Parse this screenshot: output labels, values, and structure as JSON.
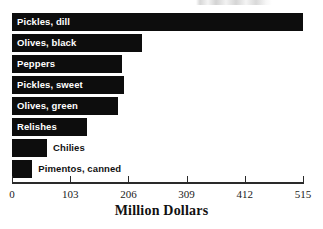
{
  "chart_data": {
    "type": "bar",
    "orientation": "horizontal",
    "title": "",
    "xlabel": "Million Dollars",
    "ylabel": "",
    "categories": [
      "Pickles, dill",
      "Olives, black",
      "Peppers",
      "Pickles, sweet",
      "Olives, green",
      "Relishes",
      "Chilies",
      "Pimentos, canned"
    ],
    "values": [
      515,
      230,
      195,
      198,
      187,
      133,
      62,
      36
    ],
    "xlim": [
      0,
      515
    ],
    "xticks": [
      0,
      103,
      206,
      309,
      412,
      515
    ],
    "xtick_labels": [
      "0",
      "103",
      "206",
      "309",
      "412",
      "515"
    ],
    "grid": false,
    "legend": null,
    "bar_color": "#0d0d0d",
    "label_inside_color": "#ffffff",
    "label_outside_color": "#111111",
    "background_color": "#ffffff"
  },
  "bars": [
    {
      "label": "Pickles, dill",
      "value": 515,
      "label_placement": "inside"
    },
    {
      "label": "Olives, black",
      "value": 230,
      "label_placement": "inside"
    },
    {
      "label": "Peppers",
      "value": 195,
      "label_placement": "inside"
    },
    {
      "label": "Pickles, sweet",
      "value": 198,
      "label_placement": "inside"
    },
    {
      "label": "Olives, green",
      "value": 187,
      "label_placement": "inside"
    },
    {
      "label": "Relishes",
      "value": 133,
      "label_placement": "inside"
    },
    {
      "label": "Chilies",
      "value": 62,
      "label_placement": "outside"
    },
    {
      "label": "Pimentos, canned",
      "value": 36,
      "label_placement": "outside"
    }
  ],
  "axis": {
    "xlabel": "Million Dollars",
    "ticks": [
      "0",
      "103",
      "206",
      "309",
      "412",
      "515"
    ]
  },
  "title_remnant": ""
}
